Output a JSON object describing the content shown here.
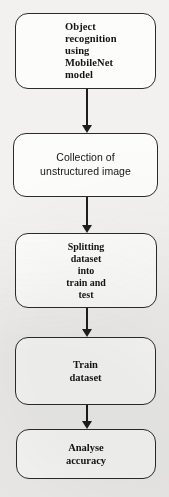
{
  "diagram": {
    "orientation": "vertical-top-down",
    "background_color": "#f2f1ef",
    "node_fill_color": "#fcfcfb",
    "node_border_color": "#2b2b2b",
    "connector_color": "#1d1d1d",
    "nodes": [
      {
        "id": "node-1",
        "label": "Object\nrecognition\nusing\nMobileNet\nmodel",
        "shape": "rounded-rectangle",
        "text_align": "left",
        "font": "serif"
      },
      {
        "id": "node-2",
        "label": "Collection of\nunstructured image",
        "shape": "rounded-rectangle",
        "text_align": "center",
        "font": "sans-serif"
      },
      {
        "id": "node-3",
        "label": "Splitting\ndataset\ninto\ntrain and\ntest",
        "shape": "rounded-rectangle",
        "text_align": "center",
        "font": "serif"
      },
      {
        "id": "node-4",
        "label": "Train\ndataset",
        "shape": "rounded-rectangle",
        "text_align": "center",
        "font": "serif"
      },
      {
        "id": "node-5",
        "label": "Analyse\naccuracy",
        "shape": "rounded-rectangle",
        "text_align": "center",
        "font": "serif"
      }
    ],
    "connectors": [
      {
        "id": "conn-1",
        "from": "node-1",
        "to": "node-2",
        "style": "solid-arrow-down"
      },
      {
        "id": "conn-2",
        "from": "node-2",
        "to": "node-3",
        "style": "solid-arrow-down"
      },
      {
        "id": "conn-3",
        "from": "node-3",
        "to": "node-4",
        "style": "solid-arrow-down"
      },
      {
        "id": "conn-4",
        "from": "node-4",
        "to": "node-5",
        "style": "solid-arrow-down"
      }
    ]
  }
}
